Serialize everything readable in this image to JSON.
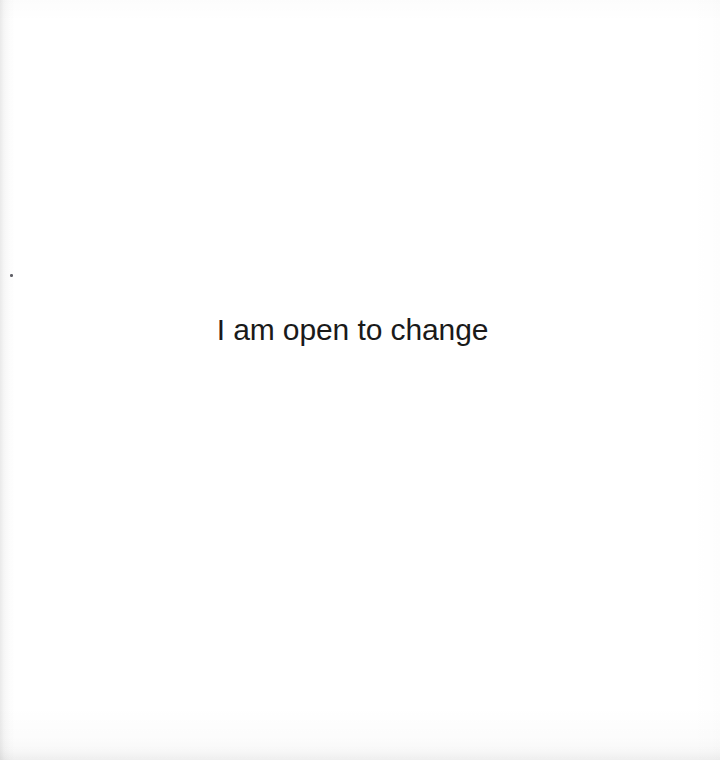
{
  "page": {
    "width": 720,
    "height": 760,
    "background_color": "#ffffff",
    "kind": "scanned-affirmation-card"
  },
  "content": {
    "affirmation": "I am open to change",
    "text_color": "#1a1a1a",
    "font_size_px": 30,
    "alignment": "center"
  },
  "artifacts": {
    "speck_label": "",
    "gutter_shadow_label": "",
    "bottom_shadow_label": "",
    "paper_tint_label": ""
  }
}
